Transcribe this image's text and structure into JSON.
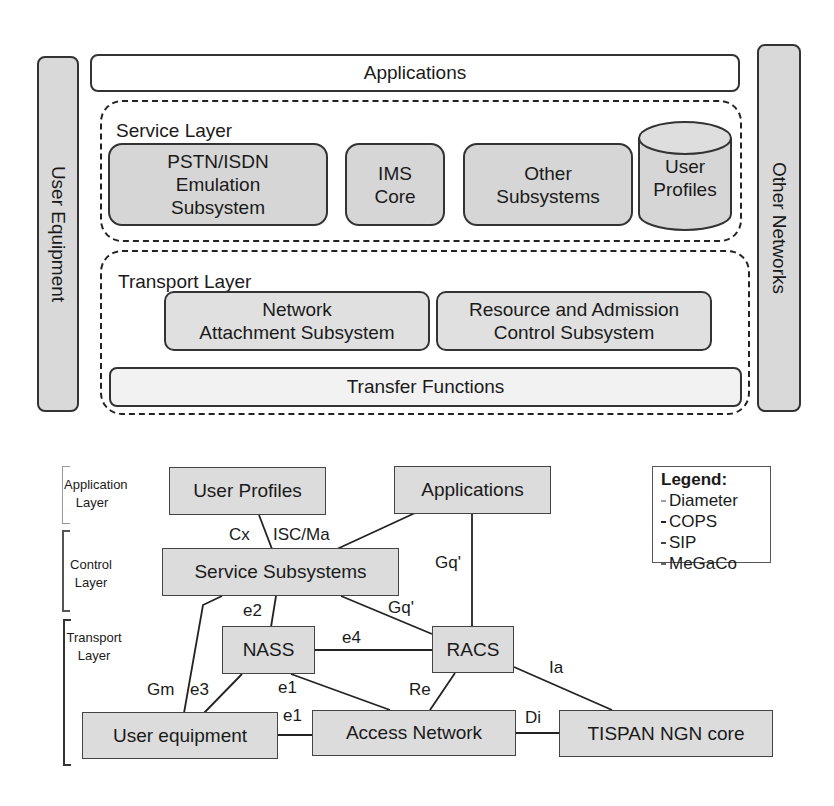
{
  "architecture": {
    "user_equipment": "User Equipment",
    "other_networks": "Other Networks",
    "applications": "Applications",
    "service_layer": {
      "label": "Service Layer",
      "components": [
        {
          "id": "pstn",
          "label": "PSTN/ISDN\nEmulation\nSubsystem",
          "lines": [
            "PSTN/ISDN",
            "Emulation",
            "Subsystem"
          ]
        },
        {
          "id": "ims",
          "label": "IMS Core",
          "lines": [
            "IMS",
            "Core"
          ]
        },
        {
          "id": "other",
          "label": "Other Subsystems",
          "lines": [
            "Other",
            "Subsystems"
          ]
        },
        {
          "id": "profiles",
          "label": "User Profiles",
          "lines": [
            "User",
            "Profiles"
          ],
          "shape": "cylinder"
        }
      ]
    },
    "transport_layer": {
      "label": "Transport Layer",
      "components": [
        {
          "id": "nass",
          "lines": [
            "Network",
            "Attachment Subsystem"
          ]
        },
        {
          "id": "racs",
          "lines": [
            "Resource and Admission",
            "Control Subsystem"
          ]
        }
      ],
      "transfer_functions": "Transfer Functions"
    }
  },
  "reference_model": {
    "layers": [
      {
        "lines": [
          "Application",
          "Layer"
        ]
      },
      {
        "lines": [
          "Control",
          "Layer"
        ]
      },
      {
        "lines": [
          "Transport",
          "Layer"
        ]
      }
    ],
    "nodes": {
      "user_profiles": "User Profiles",
      "applications": "Applications",
      "service_subsystems": "Service Subsystems",
      "nass": "NASS",
      "racs": "RACS",
      "user_equipment": "User equipment",
      "access_network": "Access Network",
      "tispan_core": "TISPAN NGN core"
    },
    "interfaces": {
      "cx": "Cx",
      "isc_ma": "ISC/Ma",
      "gq_app": "Gq'",
      "gq_ss": "Gq'",
      "e2": "e2",
      "e4": "e4",
      "gm": "Gm",
      "e3": "e3",
      "e1_nass": "e1",
      "e1_ue": "e1",
      "re": "Re",
      "ia": "Ia",
      "di": "Di"
    },
    "legend": {
      "title": "Legend:",
      "items": [
        {
          "label": "Diameter",
          "color": "#a0a0a0"
        },
        {
          "label": "COPS",
          "color": "#222222"
        },
        {
          "label": "SIP",
          "color": "#444444"
        },
        {
          "label": "MeGaCo",
          "color": "#666666"
        }
      ]
    }
  }
}
